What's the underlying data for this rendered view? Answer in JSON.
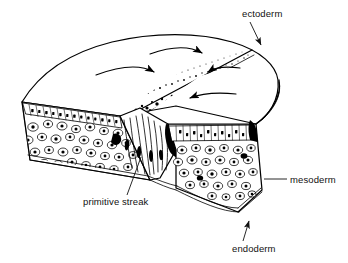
{
  "figure": {
    "style": "black-and-white line drawing",
    "background_color": "#ffffff",
    "ink_color": "#000000"
  },
  "labels": [
    {
      "id": "ectoderm",
      "text": "ectoderm",
      "text_x": 242,
      "text_y": 17,
      "anchor": "start",
      "leader": "M 252,22 L 262,47",
      "arrowhead": true,
      "arrow_at": [
        253,
        50
      ],
      "arrow_angle": 112
    },
    {
      "id": "mesoderm",
      "text": "mesoderm",
      "text_x": 289,
      "text_y": 183,
      "anchor": "start",
      "leader": "M 286,179 L 263,179",
      "arrowhead": false,
      "arrow_at": [
        263,
        179
      ],
      "arrow_angle": 180
    },
    {
      "id": "primitive-streak",
      "text": "primitive streak",
      "text_x": 83,
      "text_y": 205,
      "anchor": "start",
      "leader": "M 128,195 L 141,156",
      "arrowhead": false,
      "arrow_at": [
        141,
        156
      ],
      "arrow_angle": 288
    },
    {
      "id": "endoderm",
      "text": "endoderm",
      "text_x": 232,
      "text_y": 252,
      "anchor": "start",
      "leader": "M 243,241 L 250,223",
      "arrowhead": true,
      "arrow_at": [
        249,
        218
      ],
      "arrow_angle": 290
    }
  ],
  "germ_layers": [
    {
      "name": "ectoderm",
      "position": "top epithelial sheet",
      "cell_shape": "columnar"
    },
    {
      "name": "mesoderm",
      "position": "middle layer",
      "cell_shape": "loose round mesenchyme"
    },
    {
      "name": "endoderm",
      "position": "bottom thin sheet",
      "cell_shape": "squamous"
    }
  ],
  "features": {
    "streak_name": "primitive streak",
    "streak_description": "stippled midline groove on the epiblast surface",
    "ingression_description": "flask-shaped cells streaming inward at the streak",
    "flow_arrow_count": 4,
    "flow_meaning": "convergence of epiblast cells toward the primitive streak"
  }
}
